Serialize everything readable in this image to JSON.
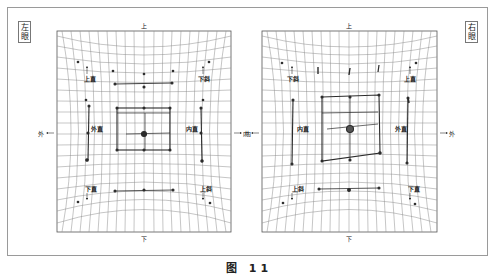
{
  "figure": {
    "caption": "图 11",
    "colors": {
      "grid": "#8c8c8c",
      "trace": "#2b2b2b",
      "frame": "#9a9a9a",
      "background": "#ffffff"
    }
  },
  "left_chart": {
    "eye_label": [
      "左",
      "眼"
    ],
    "top": "上",
    "bottom": "下",
    "left_direction": "外",
    "right_direction": "内",
    "muscles": {
      "top_left": "上直",
      "top_right": "下斜",
      "mid_left": "外直",
      "mid_right": "内直",
      "bottom_left": "下直",
      "bottom_right": "上斜"
    }
  },
  "right_chart": {
    "eye_label": [
      "右",
      "眼"
    ],
    "top": "上",
    "bottom": "下",
    "left_direction": "内",
    "right_direction": "外",
    "muscles": {
      "top_left": "下斜",
      "top_right": "上直",
      "mid_left": "内直",
      "mid_right": "外直",
      "bottom_left": "上斜",
      "bottom_right": "下直"
    }
  }
}
